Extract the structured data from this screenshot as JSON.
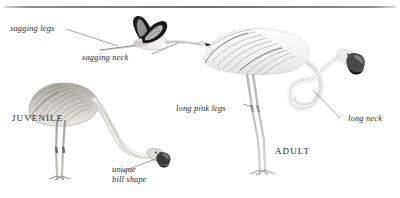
{
  "page": {
    "background_color": "#ffffff",
    "divider_color": "#6f6f6f",
    "ink_color": "#2b2b2b"
  },
  "figures": [
    {
      "id": "flying-flamingo",
      "name": "flying flamingo",
      "pose": "in flight, neck and legs outstretched",
      "plumage": "pale pink body, black flight feathers"
    },
    {
      "id": "juvenile-flamingo",
      "name": "juvenile flamingo",
      "pose": "standing, head lowered feeding",
      "plumage": "grey-brown mottled"
    },
    {
      "id": "adult-flamingo",
      "name": "adult flamingo",
      "pose": "standing, head lowered feeding",
      "plumage": "white-pink with pale pink legs"
    }
  ],
  "annotations": [
    {
      "id": "sagging-legs",
      "text": "sagging legs"
    },
    {
      "id": "sagging-neck",
      "text": "sagging neck"
    },
    {
      "id": "unique-bill-1",
      "text": "unique"
    },
    {
      "id": "unique-bill-2",
      "text": "bill shape"
    },
    {
      "id": "long-pink-legs",
      "text": "long pink legs"
    },
    {
      "id": "long-neck",
      "text": "long neck"
    }
  ],
  "age_labels": [
    {
      "id": "juvenile",
      "text": "JUVENILE"
    },
    {
      "id": "adult",
      "text": "ADULT"
    }
  ]
}
